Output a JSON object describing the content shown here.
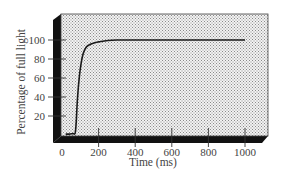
{
  "chart_data": {
    "type": "line",
    "title": "",
    "xlabel": "Time (ms)",
    "ylabel": "Percentage of full light",
    "xlim": [
      0,
      1000
    ],
    "ylim": [
      0,
      100
    ],
    "x_ticks": [
      0,
      200,
      400,
      600,
      800,
      1000
    ],
    "y_ticks": [
      20,
      40,
      60,
      80,
      100
    ],
    "grid": false,
    "legend": null,
    "background": "stippled 3D panel",
    "series": [
      {
        "name": "light response",
        "color": "#1a1a1a",
        "x": [
          20,
          40,
          60,
          72,
          78,
          85,
          95,
          105,
          115,
          125,
          135,
          150,
          175,
          200,
          250,
          300,
          400,
          600,
          800,
          1000
        ],
        "values": [
          1,
          1,
          1.5,
          2,
          15,
          40,
          62,
          76,
          85,
          90,
          93,
          95,
          97,
          98,
          99.5,
          100,
          100,
          100,
          100,
          100
        ]
      }
    ]
  },
  "labels": {
    "xlabel": "Time (ms)",
    "ylabel": "Percentage of full light",
    "x_ticks": [
      "0",
      "200",
      "400",
      "600",
      "800",
      "1000"
    ],
    "y_ticks": [
      "20",
      "40",
      "60",
      "80",
      "100"
    ]
  }
}
